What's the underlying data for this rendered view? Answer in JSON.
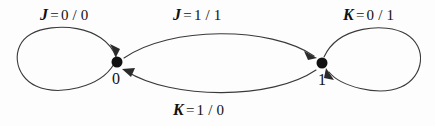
{
  "diagram": {
    "type": "state-transition-diagram",
    "background_color": "#fdfdfd",
    "stroke_color": "#3a3a3a",
    "node_color": "#111111",
    "states": [
      {
        "id": "s0",
        "label": "0",
        "x": 117,
        "y": 62,
        "radius": 5.5
      },
      {
        "id": "s1",
        "label": "1",
        "x": 322,
        "y": 63,
        "radius": 5.5
      }
    ],
    "transitions": [
      {
        "id": "t-self-0",
        "from": "s0",
        "to": "s0",
        "kind": "self-loop",
        "side": "left",
        "input": "J",
        "equals": "=",
        "io": "0 / 0",
        "label": "J = 0/0"
      },
      {
        "id": "t-0-to-1",
        "from": "s0",
        "to": "s1",
        "kind": "arc-upper",
        "input": "J",
        "equals": "=",
        "io": "1 / 1",
        "label": "J = 1/1"
      },
      {
        "id": "t-1-to-0",
        "from": "s1",
        "to": "s0",
        "kind": "arc-lower",
        "input": "K",
        "equals": "=",
        "io": "1 / 0",
        "label": "K = 1/0"
      },
      {
        "id": "t-self-1",
        "from": "s1",
        "to": "s1",
        "kind": "self-loop",
        "side": "right",
        "input": "K",
        "equals": "=",
        "io": "0 / 1",
        "label": "K = 0/1"
      }
    ]
  }
}
